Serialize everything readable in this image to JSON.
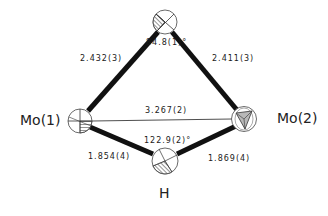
{
  "diagram": {
    "type": "molecular-structure",
    "atoms": [
      {
        "id": "bridge",
        "label": ""
      },
      {
        "id": "mo1",
        "label": "Mo(1)"
      },
      {
        "id": "mo2",
        "label": "Mo(2)"
      },
      {
        "id": "h",
        "label": "H"
      }
    ],
    "bonds": [
      {
        "from": "mo1",
        "to": "bridge",
        "length": "2.432(3)"
      },
      {
        "from": "bridge",
        "to": "mo2",
        "length": "2.411(3)"
      },
      {
        "from": "mo1",
        "to": "mo2",
        "length": "3.267(2)",
        "style": "thin"
      },
      {
        "from": "mo1",
        "to": "h",
        "length": "1.854(4)"
      },
      {
        "from": "h",
        "to": "mo2",
        "length": "1.869(4)"
      }
    ],
    "angles": [
      {
        "at": "bridge",
        "value": "84.8(1)°"
      },
      {
        "at": "h",
        "value": "122.9(2)°"
      }
    ],
    "colors": {
      "bond": "#111111",
      "hatch": "#888888",
      "shade": "#b8b8b8",
      "text": "#1a1a1a"
    }
  }
}
